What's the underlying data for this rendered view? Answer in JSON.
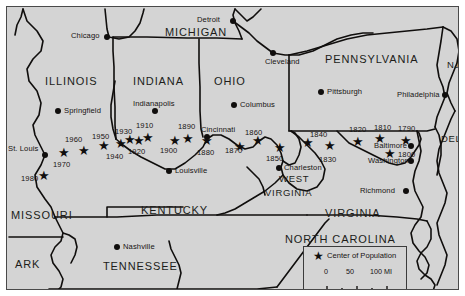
{
  "map": {
    "title": "Center of Population of the United States",
    "background_color": "#d4d4d4",
    "ink_color": "#100e0d",
    "states": [
      {
        "name": "ILLINOIS",
        "x": 38,
        "y": 68,
        "size": "normal"
      },
      {
        "name": "INDIANA",
        "x": 126,
        "y": 68,
        "size": "normal"
      },
      {
        "name": "OHIO",
        "x": 207,
        "y": 68,
        "size": "normal"
      },
      {
        "name": "MICHIGAN",
        "x": 158,
        "y": 25,
        "size": "normal"
      },
      {
        "name": "PENNSYLVANIA",
        "x": 323,
        "y": 52,
        "size": "normal"
      },
      {
        "name": "NJ",
        "x": 443,
        "y": 58,
        "size": "small"
      },
      {
        "name": "DEL",
        "x": 441,
        "y": 132,
        "size": "small"
      },
      {
        "name": "WEST",
        "x": 272,
        "y": 171,
        "size": "small"
      },
      {
        "name": "VIRGINIA",
        "x": 262,
        "y": 185,
        "size": "small"
      },
      {
        "name": "VIRGINIA",
        "x": 320,
        "y": 206,
        "size": "normal"
      },
      {
        "name": "KENTUCKY",
        "x": 134,
        "y": 203,
        "size": "normal"
      },
      {
        "name": "MISSOURI",
        "x": 6,
        "y": 208,
        "size": "normal"
      },
      {
        "name": "TENNESSEE",
        "x": 97,
        "y": 259,
        "size": "normal"
      },
      {
        "name": "ARK",
        "x": 8,
        "y": 257,
        "size": "normal"
      },
      {
        "name": "NORTH CAROLINA",
        "x": 282,
        "y": 232,
        "size": "normal"
      }
    ],
    "cities": [
      {
        "name": "Chicago",
        "dot_x": 100,
        "dot_y": 30,
        "label_x": 69,
        "label_y": 26,
        "align": "right"
      },
      {
        "name": "Detroit",
        "dot_x": 226,
        "dot_y": 14,
        "label_x": 196,
        "label_y": 10,
        "align": "right"
      },
      {
        "name": "Cleveland",
        "dot_x": 266,
        "dot_y": 46,
        "label_x": 262,
        "label_y": 52,
        "align": "left"
      },
      {
        "name": "Springfield",
        "dot_x": 51,
        "dot_y": 104,
        "label_x": 59,
        "label_y": 100,
        "align": "left"
      },
      {
        "name": "Indianapolis",
        "dot_x": 148,
        "dot_y": 104,
        "label_x": 128,
        "label_y": 96,
        "align": "left"
      },
      {
        "name": "Columbus",
        "dot_x": 227,
        "dot_y": 98,
        "label_x": 234,
        "label_y": 94,
        "align": "left"
      },
      {
        "name": "Cincinnati",
        "dot_x": 200,
        "dot_y": 130,
        "label_x": 196,
        "label_y": 121,
        "align": "left"
      },
      {
        "name": "Pittsburgh",
        "dot_x": 314,
        "dot_y": 85,
        "label_x": 321,
        "label_y": 81,
        "align": "left"
      },
      {
        "name": "Philadelphia",
        "dot_x": 438,
        "dot_y": 88,
        "label_x": 400,
        "label_y": 84,
        "align": "right"
      },
      {
        "name": "Baltimore",
        "dot_x": 404,
        "dot_y": 139,
        "label_x": 370,
        "label_y": 136,
        "align": "right"
      },
      {
        "name": "Washington",
        "dot_x": 404,
        "dot_y": 154,
        "label_x": 365,
        "label_y": 150,
        "align": "right"
      },
      {
        "name": "Richmond",
        "dot_x": 399,
        "dot_y": 184,
        "label_x": 350,
        "label_y": 180,
        "align": "right"
      },
      {
        "name": "Charleston",
        "dot_x": 272,
        "dot_y": 161,
        "label_x": 279,
        "label_y": 157,
        "align": "left"
      },
      {
        "name": "Louisville",
        "dot_x": 162,
        "dot_y": 164,
        "label_x": 170,
        "label_y": 160,
        "align": "left"
      },
      {
        "name": "Nashville",
        "dot_x": 110,
        "dot_y": 240,
        "label_x": 118,
        "label_y": 236,
        "align": "left"
      },
      {
        "name": "St. Louis",
        "dot_x": 38,
        "dot_y": 148,
        "label_x": 2,
        "label_y": 140,
        "align": "left"
      }
    ],
    "centers_of_population": [
      {
        "year": "1790",
        "star_x": 398,
        "star_y": 133,
        "label_x": 391,
        "label_y": 119
      },
      {
        "year": "1800",
        "star_x": 382,
        "star_y": 146,
        "label_x": 392,
        "label_y": 146
      },
      {
        "year": "1810",
        "star_x": 372,
        "star_y": 131,
        "label_x": 369,
        "label_y": 118
      },
      {
        "year": "1820",
        "star_x": 350,
        "star_y": 134,
        "label_x": 344,
        "label_y": 120
      },
      {
        "year": "1830",
        "star_x": 322,
        "star_y": 138,
        "label_x": 314,
        "label_y": 151
      },
      {
        "year": "1840",
        "star_x": 300,
        "star_y": 135,
        "label_x": 305,
        "label_y": 125
      },
      {
        "year": "1850",
        "star_x": 272,
        "star_y": 140,
        "label_x": 261,
        "label_y": 150
      },
      {
        "year": "1860",
        "star_x": 250,
        "star_y": 133,
        "label_x": 240,
        "label_y": 124
      },
      {
        "year": "1870",
        "star_x": 232,
        "star_y": 139,
        "label_x": 219,
        "label_y": 142
      },
      {
        "year": "1880",
        "star_x": 199,
        "star_y": 133,
        "label_x": 192,
        "label_y": 144
      },
      {
        "year": "1890",
        "star_x": 180,
        "star_y": 131,
        "label_x": 173,
        "label_y": 118
      },
      {
        "year": "1900",
        "star_x": 167,
        "star_y": 133,
        "label_x": 155,
        "label_y": 142
      },
      {
        "year": "1910",
        "star_x": 140,
        "star_y": 130,
        "label_x": 131,
        "label_y": 118
      },
      {
        "year": "1920",
        "star_x": 131,
        "star_y": 133,
        "label_x": 123,
        "label_y": 143
      },
      {
        "year": "1930",
        "star_x": 122,
        "star_y": 132,
        "label_x": 110,
        "label_y": 123
      },
      {
        "year": "1940",
        "star_x": 113,
        "star_y": 136,
        "label_x": 101,
        "label_y": 148
      },
      {
        "year": "1950",
        "star_x": 96,
        "star_y": 138,
        "label_x": 87,
        "label_y": 128
      },
      {
        "year": "1960",
        "star_x": 76,
        "star_y": 143,
        "label_x": 60,
        "label_y": 131
      },
      {
        "year": "1970",
        "star_x": 56,
        "star_y": 145,
        "label_x": 48,
        "label_y": 156
      },
      {
        "year": "1980",
        "star_x": 36,
        "star_y": 168,
        "label_x": 16,
        "label_y": 170
      }
    ],
    "legend": {
      "star_glyph": "star-icon",
      "title": "Center of Population",
      "scale_ticks": [
        "0",
        "50",
        "100 MI"
      ],
      "scale_unit": "MI"
    }
  }
}
